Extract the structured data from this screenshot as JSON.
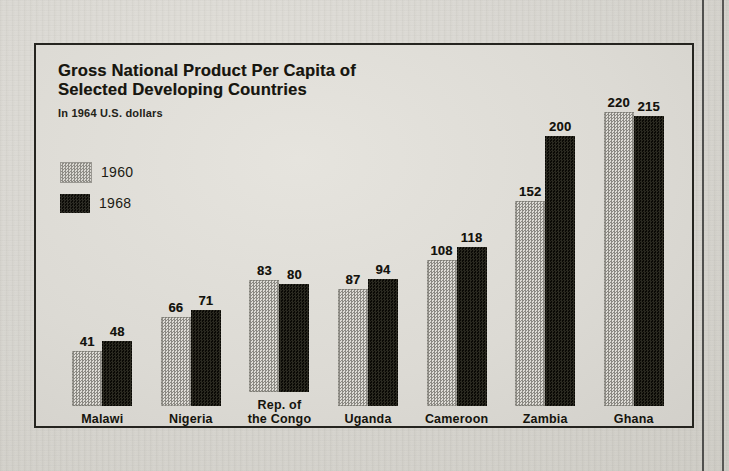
{
  "figure": {
    "title_line1": "Gross National Product Per Capita of",
    "title_line2": "Selected Developing Countries",
    "subtitle": "In 1964 U.S. dollars"
  },
  "legend": {
    "items": [
      {
        "label": "1960",
        "swatch": "light-dotted-swatch"
      },
      {
        "label": "1968",
        "swatch": "dark-solid-swatch"
      }
    ]
  },
  "chart_data": {
    "type": "bar",
    "title": "Gross National Product Per Capita of Selected Developing Countries",
    "subtitle": "In 1964 U.S. dollars",
    "xlabel": "",
    "ylabel": "GNP per capita (1964 U.S. dollars)",
    "ylim": [
      0,
      230
    ],
    "grid": false,
    "legend_position": "top-left",
    "categories": [
      "Malawi",
      "Nigeria",
      "Rep. of\nthe Congo",
      "Uganda",
      "Cameroon",
      "Zambia",
      "Ghana"
    ],
    "series": [
      {
        "name": "1960",
        "color": "#bcbab4",
        "values": [
          41,
          66,
          83,
          87,
          108,
          152,
          220
        ]
      },
      {
        "name": "1968",
        "color": "#141309",
        "values": [
          48,
          71,
          80,
          94,
          118,
          200,
          215
        ]
      }
    ]
  }
}
